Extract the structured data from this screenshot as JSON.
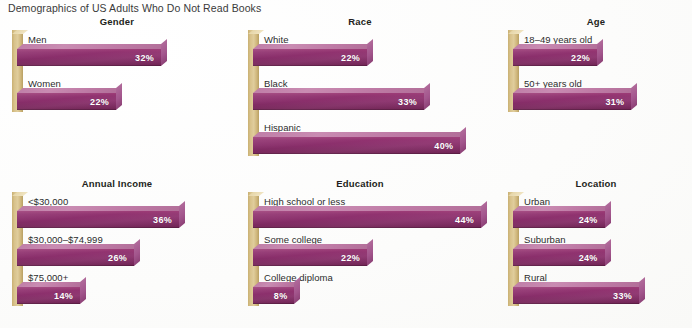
{
  "title": "Demographics of US Adults Who Do Not Read Books",
  "colors": {
    "bar_front": "#8a2f6b",
    "bar_top": "#c07fa8",
    "bar_side": "#a3568d",
    "axis_spine": "#d8c28b",
    "value_label": "#ffffff",
    "background": "#fdfdfc",
    "text": "#2c2c2c"
  },
  "chart_data": {
    "type": "bar",
    "orientation": "horizontal",
    "title": "Demographics of US Adults Who Do Not Read Books",
    "xlabel": "",
    "ylabel": "",
    "unit": "%",
    "value_suffix": "%",
    "xlim": [
      0,
      44
    ],
    "grid": false,
    "legend": "none",
    "panels": [
      {
        "title": "Gender",
        "categories": [
          "Men",
          "Women"
        ],
        "values": [
          32,
          22
        ],
        "labels": [
          "32%",
          "22%"
        ]
      },
      {
        "title": "Race",
        "categories": [
          "White",
          "Black",
          "Hispanic"
        ],
        "values": [
          22,
          33,
          40
        ],
        "labels": [
          "22%",
          "33%",
          "40%"
        ]
      },
      {
        "title": "Age",
        "categories": [
          "18–49 years old",
          "50+ years old"
        ],
        "values": [
          22,
          31
        ],
        "labels": [
          "22%",
          "31%"
        ]
      },
      {
        "title": "Annual Income",
        "categories": [
          "<$30,000",
          "$30,000–$74,999",
          "$75,000+"
        ],
        "values": [
          36,
          26,
          14
        ],
        "labels": [
          "36%",
          "26%",
          "14%"
        ]
      },
      {
        "title": "Education",
        "categories": [
          "High school or less",
          "Some college",
          "College diploma"
        ],
        "values": [
          44,
          22,
          8
        ],
        "labels": [
          "44%",
          "22%",
          "8%"
        ]
      },
      {
        "title": "Location",
        "categories": [
          "Urban",
          "Suburban",
          "Rural"
        ],
        "values": [
          24,
          24,
          33
        ],
        "labels": [
          "24%",
          "24%",
          "33%"
        ]
      }
    ]
  }
}
